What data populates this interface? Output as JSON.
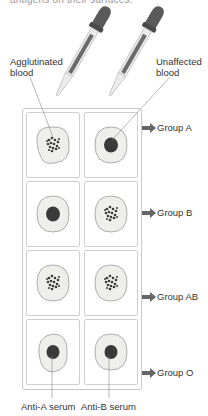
{
  "caption_fragment": "antigens on their surfaces.",
  "labels": {
    "agglutinated": "Agglutinated blood",
    "agglutinated_line1": "Agglutinated",
    "agglutinated_line2": "blood",
    "unaffected_line1": "Unaffected",
    "unaffected_line2": "blood"
  },
  "columns": [
    {
      "label": "Anti-A serum"
    },
    {
      "label": "Anti-B serum"
    }
  ],
  "groups": [
    {
      "label": "Group A",
      "anti_a": "agglutinated",
      "anti_b": "unaffected"
    },
    {
      "label": "Group B",
      "anti_a": "unaffected",
      "anti_b": "agglutinated"
    },
    {
      "label": "Group AB",
      "anti_a": "agglutinated",
      "anti_b": "agglutinated"
    },
    {
      "label": "Group O",
      "anti_a": "unaffected",
      "anti_b": "unaffected"
    }
  ],
  "icons": {
    "dropper": "dropper-icon",
    "arrow": "arrow-right-icon"
  },
  "colors": {
    "dropper_bulb": "#5a5a5a",
    "dropper_glass": "#e8e8e8",
    "blood_drop": "#3a3a3a",
    "serum_drop": "#eeeeea",
    "outline": "#9a9a9a",
    "arrow": "#666666"
  }
}
